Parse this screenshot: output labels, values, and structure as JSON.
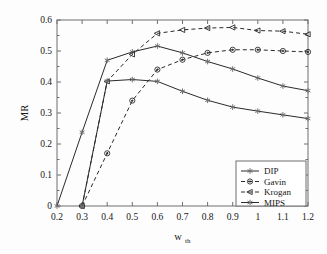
{
  "chart_data": {
    "type": "line",
    "title": "",
    "xlabel": "w_th",
    "xlabel_base": "w",
    "xlabel_sub": "th",
    "ylabel": "MR",
    "x": [
      0.2,
      0.3,
      0.4,
      0.5,
      0.6,
      0.7,
      0.8,
      0.9,
      1.0,
      1.1,
      1.2
    ],
    "xtick_labels": [
      "0.2",
      "0.3",
      "0.4",
      "0.5",
      "0.6",
      "0.7",
      "0.8",
      "0.9",
      "1",
      "1.1",
      "1.2"
    ],
    "ytick_labels": [
      "0",
      "0.1",
      "0.2",
      "0.3",
      "0.4",
      "0.5",
      "0.6"
    ],
    "ytick_values": [
      0,
      0.1,
      0.2,
      0.3,
      0.4,
      0.5,
      0.6
    ],
    "xlim": [
      0.2,
      1.2
    ],
    "ylim": [
      0,
      0.6
    ],
    "grid": false,
    "legend_position": "lower-right",
    "series": [
      {
        "name": "DIP",
        "linestyle": "solid",
        "marker": "star",
        "color": "#2a2a2a",
        "x": [
          0.2,
          0.3,
          0.4,
          0.5,
          0.6,
          0.7,
          0.8,
          0.9,
          1.0,
          1.1,
          1.2
        ],
        "values": [
          0.0,
          0.238,
          0.47,
          0.497,
          0.516,
          0.494,
          0.466,
          0.442,
          0.413,
          0.387,
          0.372
        ]
      },
      {
        "name": "Gavin",
        "linestyle": "dashed",
        "marker": "circle",
        "color": "#2a2a2a",
        "x": [
          0.3,
          0.4,
          0.5,
          0.6,
          0.7,
          0.8,
          0.9,
          1.0,
          1.1,
          1.2
        ],
        "values": [
          0.0,
          0.17,
          0.34,
          0.44,
          0.472,
          0.494,
          0.504,
          0.504,
          0.5,
          0.497
        ]
      },
      {
        "name": "Krogan",
        "linestyle": "dashed",
        "marker": "left-triangle",
        "color": "#2a2a2a",
        "x": [
          0.3,
          0.4,
          0.5,
          0.6,
          0.7,
          0.8,
          0.9,
          1.0,
          1.1,
          1.2
        ],
        "values": [
          0.0,
          0.402,
          0.489,
          0.557,
          0.568,
          0.574,
          0.576,
          0.566,
          0.564,
          0.554
        ]
      },
      {
        "name": "MIPS",
        "linestyle": "solid",
        "marker": "star",
        "color": "#2a2a2a",
        "x": [
          0.3,
          0.4,
          0.5,
          0.6,
          0.7,
          0.8,
          0.9,
          1.0,
          1.1,
          1.2
        ],
        "values": [
          0.0,
          0.403,
          0.408,
          0.402,
          0.37,
          0.341,
          0.319,
          0.306,
          0.294,
          0.282
        ]
      }
    ],
    "legend_entries": [
      "DIP",
      "Gavin",
      "Krogan",
      "MIPS"
    ]
  }
}
